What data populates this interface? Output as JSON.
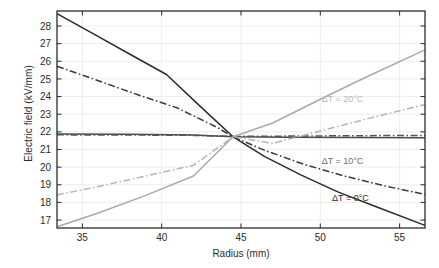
{
  "chart_data": {
    "type": "line",
    "title": "",
    "xlabel": "Radius (mm)",
    "ylabel": "Electric field (kV/mm)",
    "xlim": [
      33.4,
      56.6
    ],
    "ylim": [
      16.55,
      28.85
    ],
    "xticks": [
      35,
      40,
      45,
      50,
      55
    ],
    "yticks": [
      17,
      18,
      19,
      20,
      21,
      22,
      23,
      24,
      25,
      26,
      27,
      28
    ],
    "grid": true,
    "legend_position": "inline-annotations",
    "annotations": [
      {
        "text": "ΔT = 20°C",
        "x": 51.4,
        "y": 23.7,
        "color": "#b9b9b9"
      },
      {
        "text": "ΔT = 10°C",
        "x": 51.4,
        "y": 20.2,
        "color": "#6f6f6f"
      },
      {
        "text": "ΔT = 0°C",
        "x": 51.9,
        "y": 18.1,
        "color": "#2b2b2b"
      }
    ],
    "series": [
      {
        "name": "ΔT = 0°C (solid)",
        "style": "solid",
        "color": "#2b2b2b",
        "x": [
          33.4,
          35.7,
          38.0,
          40.3,
          42.6,
          44.5,
          46.5,
          48.8,
          51.1,
          53.4,
          56.6
        ],
        "y": [
          28.7,
          27.55,
          26.4,
          25.25,
          23.3,
          21.72,
          20.6,
          19.55,
          18.6,
          17.8,
          16.7
        ]
      },
      {
        "name": "ΔT = 0°C (dash-dot)",
        "style": "dashdot",
        "color": "#3a3a3a",
        "x": [
          33.4,
          36.0,
          38.5,
          41.0,
          43.5,
          44.5,
          46.5,
          49.0,
          51.5,
          54.0,
          56.6
        ],
        "y": [
          25.72,
          24.9,
          24.1,
          23.35,
          22.25,
          21.72,
          20.95,
          20.15,
          19.5,
          18.95,
          18.45
        ]
      },
      {
        "name": "ΔT = 10°C (solid)",
        "style": "solid",
        "color": "#4a4a4a",
        "x": [
          33.4,
          38.0,
          42.0,
          44.5,
          48.0,
          52.0,
          56.6
        ],
        "y": [
          21.88,
          21.86,
          21.82,
          21.72,
          21.7,
          21.68,
          21.66
        ]
      },
      {
        "name": "ΔT = 10°C (dash-dot)",
        "style": "dashdot",
        "color": "#555555",
        "x": [
          33.4,
          38.0,
          42.0,
          44.5,
          48.0,
          52.0,
          56.6
        ],
        "y": [
          21.83,
          21.82,
          21.8,
          21.74,
          21.76,
          21.78,
          21.8
        ]
      },
      {
        "name": "ΔT = 20°C (solid)",
        "style": "solid",
        "color": "#a9a9a9",
        "x": [
          33.4,
          36.0,
          39.0,
          42.0,
          44.5,
          47.0,
          50.0,
          53.0,
          56.6
        ],
        "y": [
          16.62,
          17.4,
          18.4,
          19.5,
          21.72,
          22.5,
          23.85,
          25.15,
          26.65
        ]
      },
      {
        "name": "ΔT = 20°C (dash-dot)",
        "style": "dashdot",
        "color": "#b5b5b5",
        "x": [
          33.4,
          36.0,
          39.0,
          42.0,
          44.5,
          47.0,
          50.0,
          53.0,
          56.6
        ],
        "y": [
          18.42,
          18.9,
          19.5,
          20.1,
          21.72,
          21.35,
          22.05,
          22.75,
          23.55
        ]
      }
    ]
  },
  "axes": {
    "x_tick_labels": [
      "35",
      "40",
      "45",
      "50",
      "55"
    ],
    "y_tick_labels": [
      "17",
      "18",
      "19",
      "20",
      "21",
      "22",
      "23",
      "24",
      "25",
      "26",
      "27",
      "28"
    ],
    "xlabel": "Radius (mm)",
    "ylabel": "Electric field (kV/mm)"
  },
  "colors": {
    "axis": "#2b2b2b",
    "grid": "#e8e8e8",
    "dark": "#2b2b2b",
    "mid": "#6f6f6f",
    "light": "#b5b5b5",
    "background": "#ffffff"
  }
}
